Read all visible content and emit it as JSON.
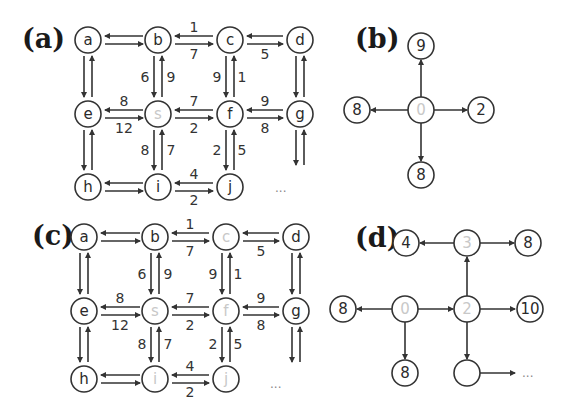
{
  "panels": {
    "a": {
      "label": "(a)",
      "nodes": [
        {
          "id": "a",
          "text": "a",
          "x": 88,
          "y": 40,
          "faded": false
        },
        {
          "id": "b",
          "text": "b",
          "x": 158,
          "y": 40,
          "faded": false
        },
        {
          "id": "c",
          "text": "c",
          "x": 230,
          "y": 40,
          "faded": false
        },
        {
          "id": "d",
          "text": "d",
          "x": 300,
          "y": 40,
          "faded": false
        },
        {
          "id": "e",
          "text": "e",
          "x": 88,
          "y": 114,
          "faded": false
        },
        {
          "id": "s",
          "text": "s",
          "x": 158,
          "y": 114,
          "faded": true
        },
        {
          "id": "f",
          "text": "f",
          "x": 230,
          "y": 114,
          "faded": false
        },
        {
          "id": "g",
          "text": "g",
          "x": 300,
          "y": 114,
          "faded": false
        },
        {
          "id": "h",
          "text": "h",
          "x": 88,
          "y": 187,
          "faded": false
        },
        {
          "id": "i",
          "text": "i",
          "x": 158,
          "y": 187,
          "faded": false
        },
        {
          "id": "j",
          "text": "j",
          "x": 230,
          "y": 187,
          "faded": false
        }
      ],
      "ellipsis": "..."
    },
    "b": {
      "label": "(b)",
      "nodes": [
        {
          "id": "top",
          "text": "9",
          "x": 421,
          "y": 46,
          "faded": false
        },
        {
          "id": "left",
          "text": "8",
          "x": 357,
          "y": 110,
          "faded": false
        },
        {
          "id": "center",
          "text": "0",
          "x": 421,
          "y": 110,
          "faded": true
        },
        {
          "id": "right",
          "text": "2",
          "x": 481,
          "y": 110,
          "faded": false
        },
        {
          "id": "bottom",
          "text": "8",
          "x": 421,
          "y": 175,
          "faded": false
        }
      ]
    },
    "c": {
      "label": "(c)",
      "nodes": [
        {
          "id": "a",
          "text": "a",
          "x": 84,
          "y": 237,
          "faded": false
        },
        {
          "id": "b",
          "text": "b",
          "x": 155,
          "y": 237,
          "faded": false
        },
        {
          "id": "c",
          "text": "c",
          "x": 226,
          "y": 237,
          "faded": true
        },
        {
          "id": "d",
          "text": "d",
          "x": 296,
          "y": 237,
          "faded": false
        },
        {
          "id": "e",
          "text": "e",
          "x": 84,
          "y": 311,
          "faded": false
        },
        {
          "id": "s",
          "text": "s",
          "x": 155,
          "y": 311,
          "faded": true
        },
        {
          "id": "f",
          "text": "f",
          "x": 226,
          "y": 311,
          "faded": true
        },
        {
          "id": "g",
          "text": "g",
          "x": 296,
          "y": 311,
          "faded": false
        },
        {
          "id": "h",
          "text": "h",
          "x": 84,
          "y": 379,
          "faded": false
        },
        {
          "id": "i",
          "text": "i",
          "x": 155,
          "y": 379,
          "faded": true
        },
        {
          "id": "j",
          "text": "j",
          "x": 226,
          "y": 379,
          "faded": true
        }
      ],
      "ellipsis": "..."
    },
    "d": {
      "label": "(d)",
      "nodes": [
        {
          "id": "n4",
          "text": "4",
          "x": 406,
          "y": 243,
          "faded": false
        },
        {
          "id": "n3",
          "text": "3",
          "x": 467,
          "y": 243,
          "faded": true
        },
        {
          "id": "n8a",
          "text": "8",
          "x": 528,
          "y": 243,
          "faded": false
        },
        {
          "id": "n8b",
          "text": "8",
          "x": 343,
          "y": 309,
          "faded": false
        },
        {
          "id": "n0",
          "text": "0",
          "x": 405,
          "y": 309,
          "faded": true
        },
        {
          "id": "n2",
          "text": "2",
          "x": 467,
          "y": 309,
          "faded": true
        },
        {
          "id": "n10",
          "text": "10",
          "x": 530,
          "y": 309,
          "faded": false
        },
        {
          "id": "n8c",
          "text": "8",
          "x": 405,
          "y": 373,
          "faded": false
        },
        {
          "id": "nblank",
          "text": "",
          "x": 467,
          "y": 373,
          "faded": true
        }
      ],
      "ellipsis": "..."
    }
  },
  "grid_weights": {
    "b_to_c_top": "1",
    "b_to_c_bottom": "7",
    "c_to_d_bottom": "5",
    "b_s_left": "6",
    "b_s_right": "9",
    "c_f_left": "9",
    "c_f_right": "1",
    "e_s_top": "8",
    "e_s_bottom": "12",
    "s_f_top": "7",
    "s_f_bottom": "2",
    "f_g_top": "9",
    "f_g_bottom": "8",
    "s_i_left": "8",
    "s_i_right": "7",
    "f_j_left": "2",
    "f_j_right": "5",
    "i_j_top": "4",
    "i_j_bottom": "2"
  }
}
